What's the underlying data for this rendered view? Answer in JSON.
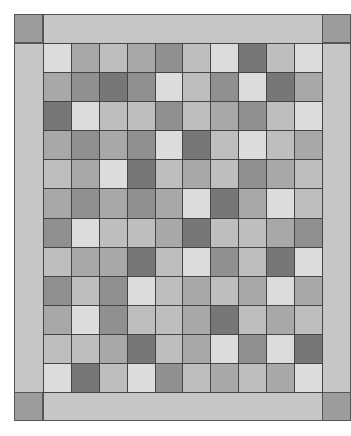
{
  "quilt": {
    "columns": 10,
    "rows": 12,
    "colors": {
      "border": "#c6c6c6",
      "corner": "#9c9c9c",
      "gridline": "#444444",
      "L": "#dcdcdc",
      "ML": "#bebebe",
      "M": "#a8a8a8",
      "MD": "#909090",
      "D": "#777777"
    },
    "cells": [
      [
        "L",
        "M",
        "ML",
        "M",
        "MD",
        "ML",
        "L",
        "D",
        "ML",
        "L"
      ],
      [
        "M",
        "MD",
        "D",
        "MD",
        "L",
        "ML",
        "MD",
        "L",
        "D",
        "M"
      ],
      [
        "D",
        "L",
        "ML",
        "ML",
        "MD",
        "ML",
        "M",
        "MD",
        "ML",
        "L"
      ],
      [
        "M",
        "MD",
        "M",
        "MD",
        "L",
        "D",
        "ML",
        "L",
        "ML",
        "M"
      ],
      [
        "ML",
        "M",
        "L",
        "D",
        "ML",
        "M",
        "ML",
        "MD",
        "M",
        "ML"
      ],
      [
        "M",
        "MD",
        "M",
        "MD",
        "M",
        "L",
        "D",
        "M",
        "L",
        "ML"
      ],
      [
        "MD",
        "L",
        "ML",
        "ML",
        "M",
        "D",
        "ML",
        "ML",
        "M",
        "MD"
      ],
      [
        "ML",
        "M",
        "M",
        "D",
        "ML",
        "L",
        "MD",
        "ML",
        "D",
        "L"
      ],
      [
        "MD",
        "ML",
        "MD",
        "L",
        "ML",
        "M",
        "ML",
        "M",
        "L",
        "M"
      ],
      [
        "M",
        "L",
        "MD",
        "ML",
        "ML",
        "M",
        "D",
        "ML",
        "M",
        "ML"
      ],
      [
        "ML",
        "ML",
        "M",
        "D",
        "ML",
        "M",
        "L",
        "MD",
        "L",
        "D"
      ],
      [
        "L",
        "D",
        "ML",
        "L",
        "MD",
        "ML",
        "M",
        "ML",
        "M",
        "L"
      ]
    ]
  }
}
